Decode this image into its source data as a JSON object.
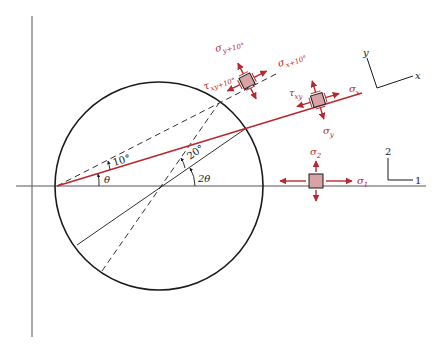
{
  "colors": {
    "ink": "#1a1a1a",
    "axis": "#555555",
    "accent": "#b8282e",
    "element_fill": "#d9a3a6"
  },
  "labels": {
    "theta": "θ",
    "two_theta": "2θ",
    "ten_deg": "10°",
    "twenty_deg": "20°",
    "sigma_x": "σ",
    "sigma_x_sub": "x",
    "sigma_y": "σ",
    "sigma_y_sub": "y",
    "tau_xy": "τ",
    "tau_xy_sub": "xy",
    "sigma_x10": "σ",
    "sigma_x10_sub": "x+10°",
    "sigma_y10": "σ",
    "sigma_y10_sub": "y+10°",
    "tau_xy10": "τ",
    "tau_xy10_sub": "xy+10°",
    "sigma_1": "σ",
    "sigma_1_sub": "1",
    "sigma_2": "σ",
    "sigma_2_sub": "2"
  },
  "axes_frames": {
    "xy": {
      "x_label": "x",
      "y_label": "y"
    },
    "principal": {
      "axis1_label": "1",
      "axis2_label": "2"
    }
  }
}
